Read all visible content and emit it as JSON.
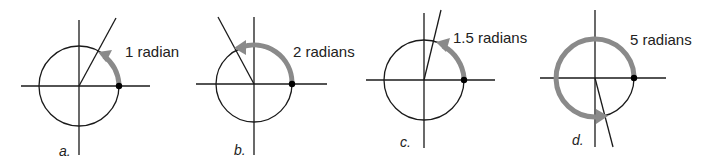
{
  "diagram": {
    "colors": {
      "line": "#1a1a1a",
      "arc": "#8a8a8a",
      "dot": "#000000",
      "background": "#ffffff"
    },
    "panels": [
      {
        "id": "a",
        "tag": "a.",
        "label": "1 radian",
        "radians": 1
      },
      {
        "id": "b",
        "tag": "b.",
        "label": "2 radians",
        "radians": 2
      },
      {
        "id": "c",
        "tag": "c.",
        "label": "1.5 radians",
        "radians": 1.5
      },
      {
        "id": "d",
        "tag": "d.",
        "label": "5 radians",
        "radians": 5
      }
    ]
  }
}
